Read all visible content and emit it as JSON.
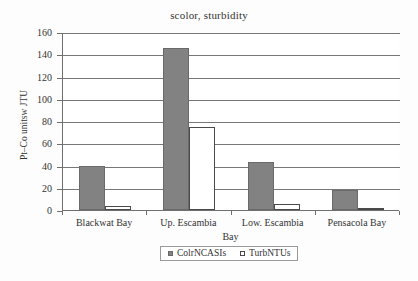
{
  "chart_data": {
    "type": "bar",
    "title": "scolor, sturbidity",
    "xlabel": "Bay",
    "ylabel": "Pt–Co unitsw JTU",
    "categories": [
      "Blackwat Bay",
      "Up. Escambia",
      "Low. Escambia",
      "Pensacola Bay"
    ],
    "series": [
      {
        "name": "ColrNCASIs",
        "values": [
          40,
          146,
          43,
          18
        ],
        "color": "#828282",
        "style": "filled"
      },
      {
        "name": "TurbNTUs",
        "values": [
          4,
          75,
          5,
          2
        ],
        "color": "#ffffff",
        "style": "hollow"
      }
    ],
    "ylim": [
      0,
      160
    ],
    "ytick_step": 20,
    "yticks": [
      "160",
      "140",
      "120",
      "100",
      "80",
      "60",
      "40",
      "20",
      "0"
    ],
    "grid": true,
    "legend_position": "bottom-center"
  }
}
